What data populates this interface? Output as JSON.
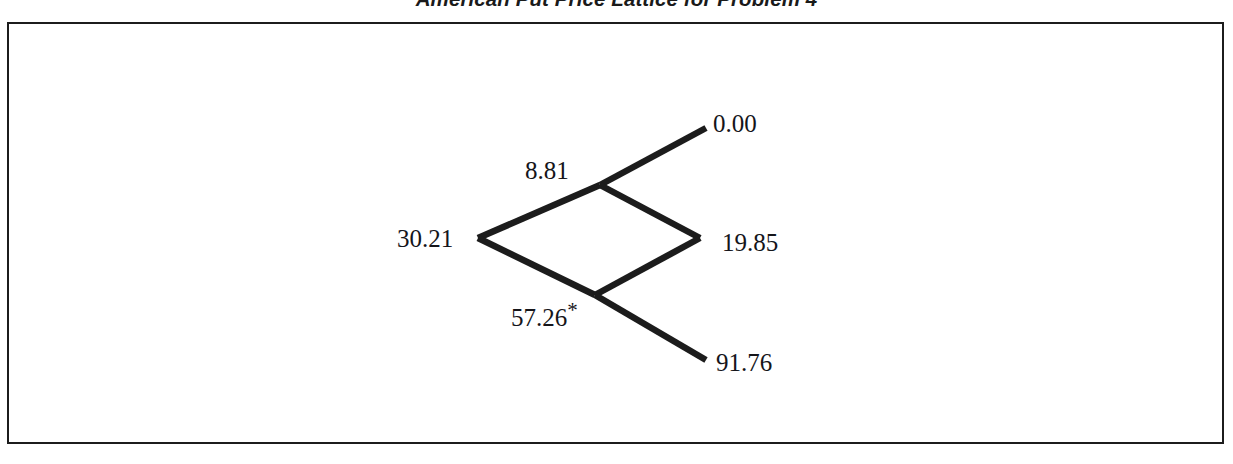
{
  "figure": {
    "title": "American Put Price Lattice for Problem 4",
    "frame": {
      "border_color": "#1c1c1c"
    },
    "line_color": "#1c1c1c",
    "text_color": "#15151a"
  },
  "chart_data": {
    "type": "diagram",
    "diagram_kind": "binomial-lattice",
    "title": "American Put Price Lattice for Problem 4",
    "xlabel": "",
    "ylabel": "",
    "grid": false,
    "legend": null,
    "annotations": [
      "* marks the node where early exercise is optimal"
    ],
    "steps": 2,
    "nodes": [
      {
        "id": "root",
        "label": "30.21",
        "step": 0,
        "up_moves": 0,
        "value": 30.21,
        "x": 478,
        "y": 238,
        "marked": false
      },
      {
        "id": "up",
        "label": "8.81",
        "step": 1,
        "up_moves": 1,
        "value": 8.81,
        "x": 600,
        "y": 185,
        "marked": false
      },
      {
        "id": "down",
        "label": "57.26*",
        "step": 1,
        "up_moves": 0,
        "value": 57.26,
        "x": 595,
        "y": 295,
        "marked": true
      },
      {
        "id": "upup",
        "label": "0.00",
        "step": 2,
        "up_moves": 2,
        "value": 0.0,
        "x": 706,
        "y": 128,
        "marked": false
      },
      {
        "id": "updown",
        "label": "19.85",
        "step": 2,
        "up_moves": 1,
        "value": 19.85,
        "x": 700,
        "y": 238,
        "marked": false
      },
      {
        "id": "downdown",
        "label": "91.76",
        "step": 2,
        "up_moves": 0,
        "value": 91.76,
        "x": 706,
        "y": 360,
        "marked": false
      }
    ],
    "edges": [
      {
        "from": "root",
        "to": "up"
      },
      {
        "from": "root",
        "to": "down"
      },
      {
        "from": "up",
        "to": "upup"
      },
      {
        "from": "up",
        "to": "updown"
      },
      {
        "from": "down",
        "to": "updown"
      },
      {
        "from": "down",
        "to": "downdown"
      }
    ],
    "values": [
      30.21,
      8.81,
      57.26,
      0.0,
      19.85,
      91.76
    ],
    "categories": [
      "30.21",
      "8.81",
      "57.26*",
      "0.00",
      "19.85",
      "91.76"
    ]
  }
}
